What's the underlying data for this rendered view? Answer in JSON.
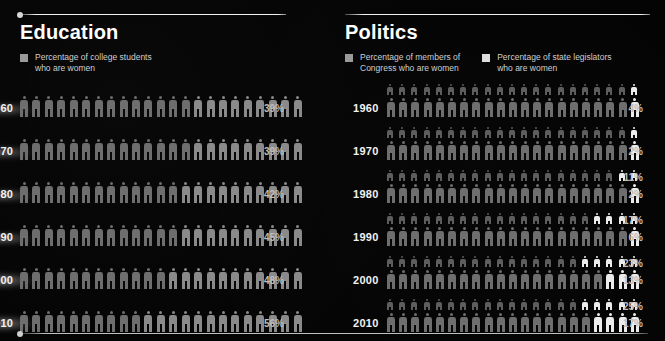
{
  "meta": {
    "background": "#050505",
    "accent_dim": "#8f8f8f",
    "accent_bright": "#ededed",
    "rule_color": "#ffffff"
  },
  "sections": [
    {
      "id": "education",
      "title": "Education",
      "legend": [
        {
          "swatch": "#9a9a9a",
          "text": "Percentage of college students\nwho are women"
        }
      ],
      "rows": [
        {
          "year": "960",
          "full_year": "1960",
          "pct_label": "39%",
          "bars": [
            {
              "series": "college-students",
              "value": 39,
              "total": 23,
              "scale": "large"
            }
          ]
        },
        {
          "year": "970",
          "full_year": "1970",
          "pct_label": "39%",
          "bars": [
            {
              "series": "college-students",
              "value": 39,
              "total": 23,
              "scale": "large"
            }
          ]
        },
        {
          "year": "980",
          "full_year": "1980",
          "pct_label": "42%",
          "bars": [
            {
              "series": "college-students",
              "value": 42,
              "total": 23,
              "scale": "large"
            }
          ]
        },
        {
          "year": "990",
          "full_year": "1990",
          "pct_label": "45%",
          "bars": [
            {
              "series": "college-students",
              "value": 45,
              "total": 23,
              "scale": "large"
            }
          ]
        },
        {
          "year": "000",
          "full_year": "2000",
          "pct_label": "48%",
          "bars": [
            {
              "series": "college-students",
              "value": 48,
              "total": 23,
              "scale": "large"
            }
          ]
        },
        {
          "year": "010",
          "full_year": "2010",
          "pct_label": "56%",
          "bars": [
            {
              "series": "college-students",
              "value": 56,
              "total": 23,
              "scale": "large"
            }
          ]
        }
      ]
    },
    {
      "id": "politics",
      "title": "Politics",
      "legend": [
        {
          "swatch": "#9a9a9a",
          "text": "Percentage of members of\nCongress who are women"
        },
        {
          "swatch": "#dedede",
          "text": "Percentage of state legislators\nwho are women"
        }
      ],
      "rows": [
        {
          "year": "1960",
          "full_year": "1960",
          "pct_label": "4%",
          "bars": [
            {
              "series": "state-legislators",
              "value": 4,
              "total": 21,
              "scale": "small",
              "pct_label": ""
            },
            {
              "series": "congress",
              "value": 4,
              "total": 21,
              "scale": "large",
              "pct_label": "4%"
            }
          ]
        },
        {
          "year": "1970",
          "full_year": "1970",
          "pct_label": "2%",
          "bars": [
            {
              "series": "state-legislators",
              "value": 2,
              "total": 21,
              "scale": "small",
              "pct_label": ""
            },
            {
              "series": "congress",
              "value": 2,
              "total": 21,
              "scale": "large",
              "pct_label": "2%"
            }
          ]
        },
        {
          "year": "1980",
          "full_year": "1980",
          "pct_label": "11%",
          "bars": [
            {
              "series": "state-legislators",
              "value": 11,
              "total": 21,
              "scale": "small",
              "pct_label": "11%"
            },
            {
              "series": "congress",
              "value": 2,
              "total": 21,
              "scale": "large",
              "pct_label": "2%"
            }
          ]
        },
        {
          "year": "1990",
          "full_year": "1990",
          "pct_label": "17%",
          "bars": [
            {
              "series": "state-legislators",
              "value": 17,
              "total": 21,
              "scale": "small",
              "pct_label": "17%"
            },
            {
              "series": "congress",
              "value": 6,
              "total": 21,
              "scale": "large",
              "pct_label": "6%"
            }
          ]
        },
        {
          "year": "2000",
          "full_year": "2000",
          "pct_label": "23%",
          "bars": [
            {
              "series": "state-legislators",
              "value": 23,
              "total": 21,
              "scale": "small",
              "pct_label": "23%"
            },
            {
              "series": "congress",
              "value": 13,
              "total": 21,
              "scale": "large",
              "pct_label": "13%"
            }
          ]
        },
        {
          "year": "2010",
          "full_year": "2010",
          "pct_label": "25%",
          "bars": [
            {
              "series": "state-legislators",
              "value": 25,
              "total": 21,
              "scale": "small",
              "pct_label": "25%"
            },
            {
              "series": "congress",
              "value": 17,
              "total": 21,
              "scale": "large",
              "pct_label": "17%"
            }
          ]
        }
      ]
    }
  ],
  "chart_data": {
    "type": "bar",
    "xlabel": "",
    "ylabel": "",
    "categories": [
      "1960",
      "1970",
      "1980",
      "1990",
      "2000",
      "2010"
    ],
    "series": [
      {
        "name": "Percentage of college students who are women",
        "values": [
          39,
          39,
          42,
          45,
          48,
          56
        ],
        "unit": "%",
        "section": "Education"
      },
      {
        "name": "Percentage of members of Congress who are women",
        "values": [
          4,
          2,
          2,
          6,
          13,
          17
        ],
        "unit": "%",
        "section": "Politics"
      },
      {
        "name": "Percentage of state legislators who are women",
        "values": [
          4,
          2,
          11,
          17,
          23,
          25
        ],
        "unit": "%",
        "section": "Politics"
      }
    ],
    "ylim": [
      0,
      100
    ],
    "grid": false,
    "legend_position": "top",
    "encoding": "pictogram / isotype rows; each figure represents a share of the whole, filled figures highlighted from the right"
  }
}
